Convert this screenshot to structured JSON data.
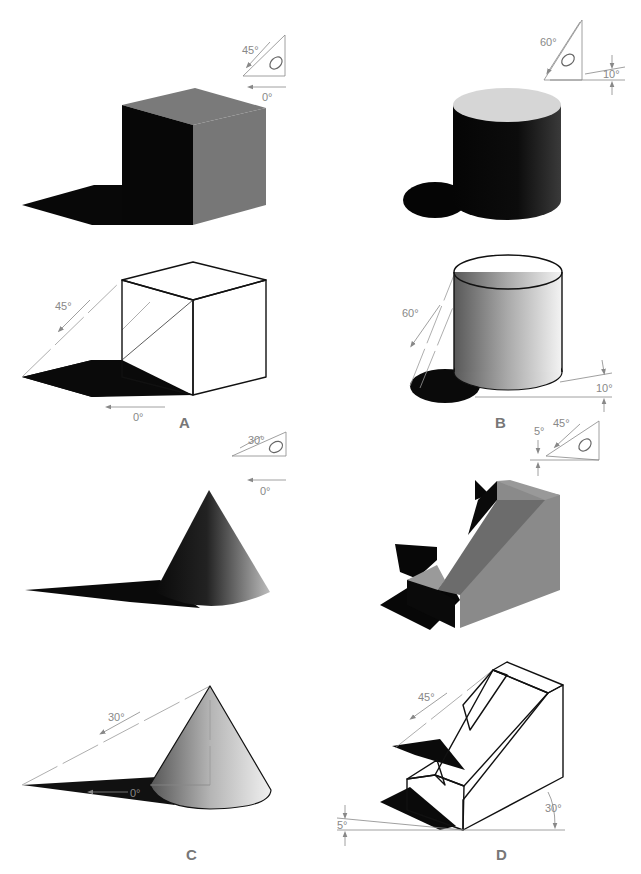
{
  "figure": {
    "panels": [
      {
        "id": "A",
        "label": "A",
        "object": "cube",
        "light_angle": "45°",
        "light_direction": "0°",
        "indicator": {
          "angle_label": "45°",
          "direction_label": "0°"
        },
        "construction": {
          "angle_label": "45°",
          "direction_label": "0°"
        }
      },
      {
        "id": "B",
        "label": "B",
        "object": "cylinder",
        "light_angle": "60°",
        "light_direction": "10°",
        "indicator": {
          "angle_label": "60°",
          "direction_label": "10°"
        },
        "construction": {
          "angle_label": "60°",
          "direction_label": "10°"
        }
      },
      {
        "id": "C",
        "label": "C",
        "object": "cone",
        "light_angle": "30°",
        "light_direction": "0°",
        "indicator": {
          "angle_label": "30°",
          "direction_label": "0°"
        },
        "construction": {
          "angle_label": "30°",
          "direction_label": "0°"
        }
      },
      {
        "id": "D",
        "label": "D",
        "object": "wedge block",
        "light_angle": "45°",
        "light_direction": "5°",
        "indicator": {
          "angle_label": "45°",
          "direction_label": "5°"
        },
        "construction": {
          "angle_label": "45°",
          "offset_label": "5°",
          "axis_label": "30°"
        }
      }
    ],
    "colors": {
      "shadow": "#0a0a0a",
      "dark_face": "#111111",
      "mid_face": "#7a7a7a",
      "light_face": "#d8d8d8",
      "construction_line": "#999999",
      "label_text": "#888888"
    }
  }
}
